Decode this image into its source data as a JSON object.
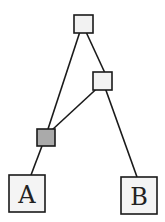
{
  "diagram": {
    "type": "tree",
    "nodes": [
      {
        "id": "root",
        "label": "",
        "kind": "internal",
        "fill": "#f2f2f2"
      },
      {
        "id": "mid",
        "label": "",
        "kind": "internal",
        "fill": "#f2f2f2"
      },
      {
        "id": "hybrid",
        "label": "",
        "kind": "reticulation",
        "fill": "#aaaaaa"
      },
      {
        "id": "A",
        "label": "A",
        "kind": "leaf",
        "fill": "#f4f4f4"
      },
      {
        "id": "B",
        "label": "B",
        "kind": "leaf",
        "fill": "#f4f4f4"
      }
    ],
    "edges": [
      {
        "from": "root",
        "to": "hybrid"
      },
      {
        "from": "root",
        "to": "mid"
      },
      {
        "from": "mid",
        "to": "hybrid"
      },
      {
        "from": "mid",
        "to": "B"
      },
      {
        "from": "hybrid",
        "to": "A"
      }
    ]
  }
}
